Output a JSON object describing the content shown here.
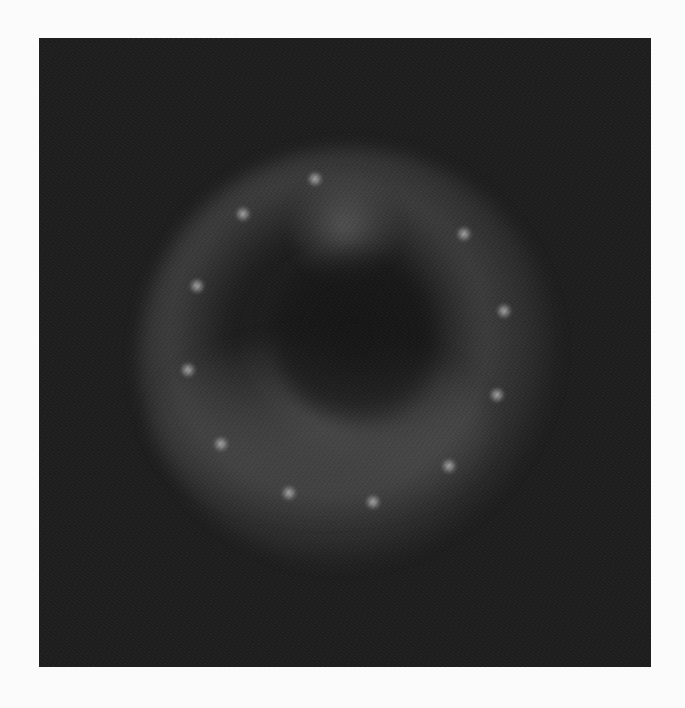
{
  "image": {
    "description": "Grayscale diffraction-like pattern: dark square field with a bright diffuse arc and a ring of bright spots",
    "frame": {
      "left": 39,
      "top": 38,
      "width": 612,
      "height": 629
    },
    "colors": {
      "page_background": "#fbfbfb",
      "field": "#1e1e1e",
      "spot": "#c8c8c8"
    },
    "spots": [
      {
        "x": 204,
        "y": 176
      },
      {
        "x": 276,
        "y": 141
      },
      {
        "x": 425,
        "y": 196
      },
      {
        "x": 158,
        "y": 248
      },
      {
        "x": 465,
        "y": 273
      },
      {
        "x": 149,
        "y": 332
      },
      {
        "x": 458,
        "y": 357
      },
      {
        "x": 182,
        "y": 406
      },
      {
        "x": 410,
        "y": 428
      },
      {
        "x": 250,
        "y": 455
      },
      {
        "x": 334,
        "y": 464
      }
    ]
  }
}
